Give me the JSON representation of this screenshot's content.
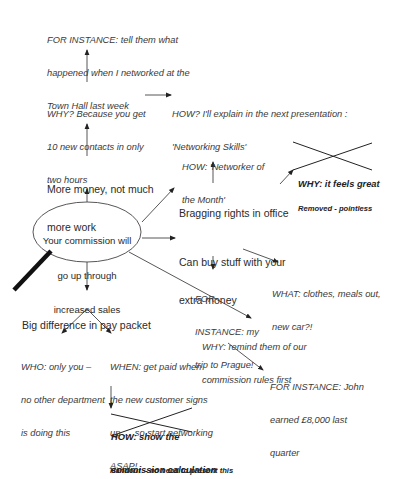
{
  "diagram": {
    "type": "mind-map",
    "central_node": {
      "lines": [
        "Your commission will",
        "go up through",
        "increased sales"
      ]
    },
    "branches": {
      "money": {
        "label": [
          "More money, not much",
          "more work"
        ],
        "why": [
          "WHY? Because you get",
          "10 new contacts in only",
          "two hours"
        ],
        "for_instance": [
          "FOR INSTANCE: tell them what",
          "happened when I networked at the",
          "Town Hall last week"
        ],
        "how": [
          "HOW? I'll explain in the next presentation :",
          "'Networking Skills'"
        ]
      },
      "bragging": {
        "label": "Bragging rights in office",
        "how": [
          "HOW: 'Networker of",
          "the Month'"
        ],
        "why_removed": "WHY: it feels great",
        "removed_note": "Removed - pointless"
      },
      "buy_stuff": {
        "label": [
          "Can buy stuff with your",
          "extra money"
        ],
        "for_instance": [
          "FOR",
          "INSTANCE: my",
          "trip to Prague!"
        ],
        "what": [
          "WHAT: clothes, meals out,",
          "new car?!"
        ]
      },
      "rules": {
        "why": [
          "WHY: remind them of our",
          "commission rules first"
        ],
        "for_instance": [
          "FOR INSTANCE: John",
          "earned £8,000 last",
          "quarter"
        ]
      },
      "pay_packet": {
        "label": "Big difference in pay packet",
        "who": [
          "WHO: only you –",
          "no other department",
          "is doing this"
        ],
        "when": [
          "WHEN: get paid when",
          "the new customer signs",
          "up … so start networking",
          "ASAP!"
        ],
        "how_removed": [
          "HOW: show the",
          "commission calculation"
        ],
        "removed_note": "Handout  - no need to present this"
      }
    },
    "colors": {
      "line": "#333333",
      "text": "#2a2a2a",
      "strike": "#222222",
      "pointer": "#111111"
    }
  }
}
